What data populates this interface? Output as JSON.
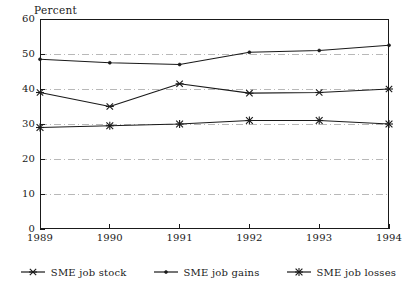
{
  "chart_data": {
    "type": "line",
    "title": "Percent",
    "xlabel": "",
    "ylabel": "Percent",
    "x": [
      "1989",
      "1990",
      "1991",
      "1992",
      "1993",
      "1994"
    ],
    "categories": [
      "1989",
      "1990",
      "1991",
      "1992",
      "1993",
      "1994"
    ],
    "ylim": [
      0,
      60
    ],
    "yticks": [
      0,
      10,
      20,
      30,
      40,
      50,
      60
    ],
    "ytick_labels": [
      "0",
      "10",
      "20",
      "30",
      "40",
      "50",
      "60"
    ],
    "xtick_labels": [
      "1989",
      "1990",
      "1991",
      "1992",
      "1993",
      "1994"
    ],
    "grid": true,
    "grid_style": "dashed-light",
    "legend_position": "bottom-center",
    "series": [
      {
        "name": "SME job stock",
        "marker": "x-asterisk",
        "values": [
          39,
          35,
          41.5,
          38.8,
          39,
          40
        ]
      },
      {
        "name": "SME job gains",
        "marker": "dot",
        "values": [
          48.5,
          47.5,
          47,
          50.5,
          51,
          52.5
        ]
      },
      {
        "name": "SME job losses",
        "marker": "asterisk",
        "values": [
          29,
          29.5,
          30,
          31,
          31,
          30
        ]
      }
    ]
  },
  "legend": {
    "items": [
      {
        "label": "SME job stock"
      },
      {
        "label": "SME job gains"
      },
      {
        "label": "SME job losses"
      }
    ]
  },
  "colors": {
    "axis": "#1a1a1a",
    "series": "#1a1a1a",
    "grid": "#9a9a9a",
    "background": "#ffffff"
  }
}
